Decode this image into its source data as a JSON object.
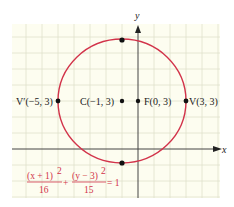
{
  "figure": {
    "axes": {
      "x_label": "x",
      "y_label": "y"
    },
    "grid": {
      "unit_px": 16,
      "x_range": [
        -8,
        5
      ],
      "y_range": [
        -2,
        7.5
      ],
      "background": "#fdfdf0",
      "line_color": "#d9dcc8"
    },
    "curve": {
      "type": "ellipse",
      "center": [
        -1,
        3
      ],
      "a": 4,
      "b": 3.873,
      "color": "#d2334a"
    },
    "points": [
      {
        "id": "vprime",
        "label": "V′(−5, 3)",
        "x": -5,
        "y": 3
      },
      {
        "id": "center",
        "label": "C(−1, 3)",
        "x": -1,
        "y": 3
      },
      {
        "id": "focus",
        "label": "F(0, 3)",
        "x": 0,
        "y": 3
      },
      {
        "id": "vertex",
        "label": "V(3, 3)",
        "x": 3,
        "y": 3
      },
      {
        "id": "top",
        "label": "",
        "x": -1,
        "y": 6.873
      },
      {
        "id": "bottom",
        "label": "",
        "x": -1,
        "y": -0.873
      }
    ],
    "equation": {
      "num1": "(x + 1)",
      "exp1": "2",
      "den1": "16",
      "plus": "+",
      "num2": "(y − 3)",
      "exp2": "2",
      "den2": "15",
      "rhs": "= 1"
    }
  }
}
